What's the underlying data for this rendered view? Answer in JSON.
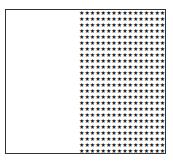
{
  "figure": {
    "left_region": {
      "fill": "empty"
    },
    "right_region": {
      "fill": "stars",
      "star_glyph": "★",
      "columns": 17,
      "rows": 27,
      "star_color": "#1a1a1a"
    },
    "border_color": "#333333",
    "background_color": "#ffffff"
  }
}
